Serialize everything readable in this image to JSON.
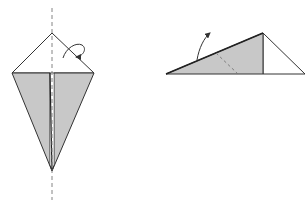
{
  "diagram": {
    "type": "origami-fold-instructions",
    "colors": {
      "background": "#ffffff",
      "paper_colored": "#c8c8c8",
      "paper_white": "#ffffff",
      "line": "#333333",
      "dashed": "#777777"
    },
    "steps": [
      {
        "id": "kite-base",
        "description": "Kite shape with colored lower flaps, vertical valley/mountain fold line through center, curled arrow indicating fold behind",
        "fold_line": "vertical-dashed",
        "arrow": "fold-behind-curl"
      },
      {
        "id": "folded-half",
        "description": "Kite folded in half into triangle, dashed diagonal fold line, arrow indicating flap lifted up",
        "fold_line": "diagonal-dashed",
        "arrow": "fold-up"
      }
    ]
  }
}
